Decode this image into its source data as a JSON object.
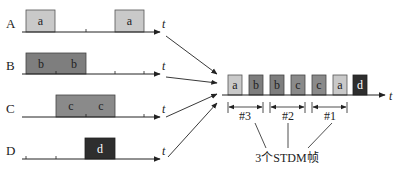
{
  "diagram": {
    "time_axis_label": "t",
    "colors": {
      "a": "#c9c9c9",
      "b": "#7e7e7e",
      "c": "#8a8a8a",
      "d": "#2e2e2e",
      "text_dark": "#222222",
      "text_light": "#ffffff"
    },
    "inputs": [
      {
        "label": "A",
        "blocks": [
          {
            "text": "a",
            "x": 26,
            "w": 29
          },
          {
            "text": "a",
            "x": 115,
            "w": 29
          }
        ]
      },
      {
        "label": "B",
        "blocks": [
          {
            "text": "b",
            "x": 26,
            "w": 30
          },
          {
            "text": "b",
            "x": 56,
            "w": 30
          }
        ],
        "merged": true
      },
      {
        "label": "C",
        "blocks": [
          {
            "text": "c",
            "x": 56,
            "w": 30
          },
          {
            "text": "c",
            "x": 86,
            "w": 29
          }
        ],
        "merged": true
      },
      {
        "label": "D",
        "blocks": [
          {
            "text": "d",
            "x": 85,
            "w": 30
          }
        ]
      }
    ],
    "output": {
      "slots": [
        "a",
        "b",
        "b",
        "c",
        "c",
        "a",
        "d"
      ],
      "frames": [
        {
          "label": "#3"
        },
        {
          "label": "#2"
        },
        {
          "label": "#1"
        }
      ],
      "caption": "3个STDM帧"
    }
  }
}
